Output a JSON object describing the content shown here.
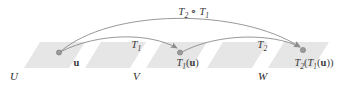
{
  "figure": {
    "kind": "composition-of-linear-transformations-diagram",
    "background_color": "#ffffff",
    "band_color": "#e6e6e6",
    "stroke_color": "#8c8c8c",
    "dot_color": "#9a9a9a",
    "text_color": "#3a3a3a"
  },
  "spaces": {
    "domain_label": "U",
    "middle_label": "V",
    "codomain_label": "W"
  },
  "points": {
    "u": {
      "base": "u",
      "full": "u"
    },
    "t1u": {
      "fn": "T",
      "sub": "1",
      "open": "(",
      "arg": "u",
      "close": ")"
    },
    "t2t1u": {
      "fn_outer": "T",
      "sub_outer": "2",
      "open_outer": "(",
      "fn_inner": "T",
      "sub_inner": "1",
      "open_inner": "(",
      "arg": "u",
      "close_inner": ")",
      "close_outer": ")"
    }
  },
  "arrows": {
    "t1": {
      "fn": "T",
      "sub": "1"
    },
    "t2": {
      "fn": "T",
      "sub": "2"
    },
    "composition": {
      "fn_outer": "T",
      "sub_outer": "2",
      "operator": "∘",
      "fn_inner": "T",
      "sub_inner": "1"
    }
  }
}
